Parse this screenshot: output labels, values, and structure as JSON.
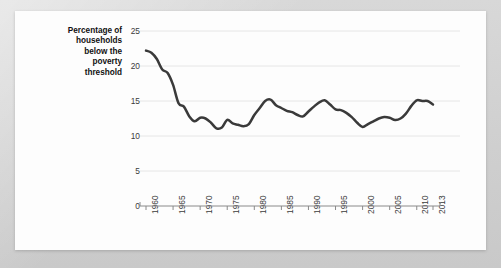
{
  "chart_data": {
    "type": "line",
    "title": "",
    "subtitle": "",
    "xlabel": "",
    "ylabel": "Percentage of households below the poverty threshold",
    "ylabel_lines": [
      "Percentage of",
      "households",
      "below the",
      "poverty",
      "threshold"
    ],
    "ylim": [
      0,
      25
    ],
    "xlim": [
      1960,
      2013
    ],
    "yticks": [
      0,
      5,
      10,
      15,
      20,
      25
    ],
    "ytick_labels": [
      "0",
      "5",
      "10",
      "15",
      "20",
      "25"
    ],
    "xticks": [
      1960,
      1965,
      1970,
      1975,
      1980,
      1985,
      1990,
      1995,
      2000,
      2005,
      2010,
      2013
    ],
    "xtick_labels": [
      "1960",
      "1965",
      "1970",
      "1975",
      "1980",
      "1985",
      "1990",
      "1995",
      "2000",
      "2005",
      "2010",
      "2013"
    ],
    "xtick_rotation": 90,
    "grid": "horizontal",
    "legend": "none",
    "line_color": "#3a3a3a",
    "line_width": 2.5,
    "grid_color": "#e6e6e6",
    "axis_color": "#8a8a8a",
    "background_color": "#fdfdfd",
    "page_background_color": "#d3d3d3",
    "series": [
      {
        "name": "Percentage of households below the poverty threshold",
        "x": [
          1960,
          1961,
          1962,
          1963,
          1964,
          1965,
          1966,
          1967,
          1968,
          1969,
          1970,
          1971,
          1972,
          1973,
          1974,
          1975,
          1976,
          1977,
          1978,
          1979,
          1980,
          1981,
          1982,
          1983,
          1984,
          1985,
          1986,
          1987,
          1988,
          1989,
          1990,
          1991,
          1992,
          1993,
          1994,
          1995,
          1996,
          1997,
          1998,
          1999,
          2000,
          2001,
          2002,
          2003,
          2004,
          2005,
          2006,
          2007,
          2008,
          2009,
          2010,
          2011,
          2012,
          2013
        ],
        "values": [
          22.2,
          21.9,
          21.0,
          19.5,
          19.0,
          17.3,
          14.7,
          14.2,
          12.8,
          12.1,
          12.6,
          12.5,
          11.9,
          11.1,
          11.2,
          12.3,
          11.8,
          11.6,
          11.4,
          11.7,
          13.0,
          14.0,
          15.0,
          15.2,
          14.4,
          14.0,
          13.6,
          13.4,
          13.0,
          12.8,
          13.5,
          14.2,
          14.8,
          15.1,
          14.5,
          13.8,
          13.7,
          13.3,
          12.7,
          11.9,
          11.3,
          11.7,
          12.1,
          12.5,
          12.7,
          12.6,
          12.3,
          12.5,
          13.2,
          14.3,
          15.1,
          15.0,
          15.0,
          14.5
        ],
        "color": "#3a3a3a"
      }
    ]
  },
  "plot_geometry": {
    "x_left_px": 146,
    "x_right_px": 433,
    "y_top_px": 31,
    "y_bottom_px": 206
  }
}
